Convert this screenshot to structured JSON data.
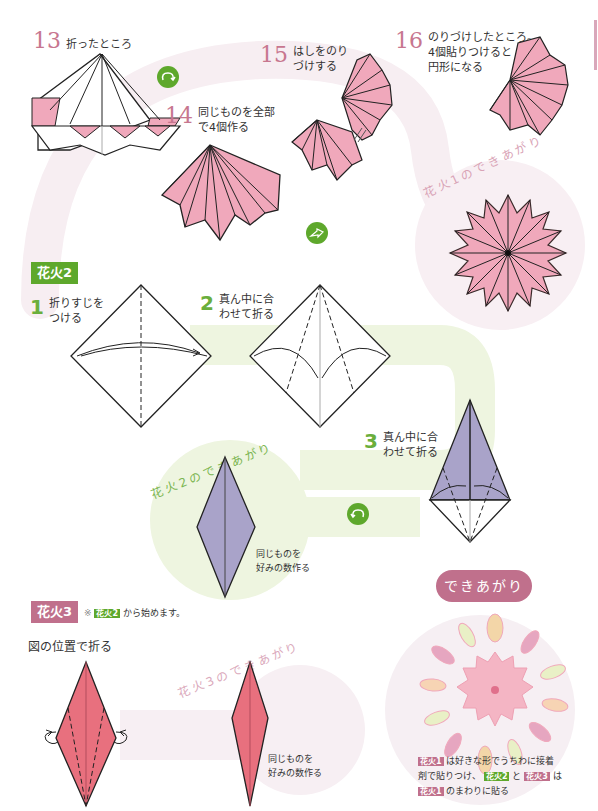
{
  "steps_top": {
    "step13": {
      "num": "13",
      "text": "折ったところ"
    },
    "step14": {
      "num": "14",
      "text_line1": "同じものを全部",
      "text_line2": "で4個作る"
    },
    "step15": {
      "num": "15",
      "text_line1": "はしをのり",
      "text_line2": "づけする"
    },
    "step16": {
      "num": "16",
      "text_line1": "のりづけしたところ。",
      "text_line2": "4個貼りつけると",
      "text_line3": "円形になる"
    },
    "finished1_label": "花火1のできあがり"
  },
  "hanabi2": {
    "title": "花火2",
    "step1": {
      "num": "1",
      "text_line1": "折りすじを",
      "text_line2": "つける"
    },
    "step2": {
      "num": "2",
      "text_line1": "真ん中に合",
      "text_line2": "わせて折る"
    },
    "step3": {
      "num": "3",
      "text_line1": "真ん中に合",
      "text_line2": "わせて折る"
    },
    "finished_label": "花火2のできあがり",
    "note_line1": "同じものを",
    "note_line2": "好みの数作る"
  },
  "hanabi3": {
    "title": "花火3",
    "note_prefix": "※",
    "note_tag": "花火2",
    "note_suffix": "から始めます。",
    "instruction": "図の位置で折る",
    "finished_label": "花火3のできあがり",
    "note_line1": "同じものを",
    "note_line2": "好みの数作る"
  },
  "final": {
    "title": "できあがり",
    "desc": {
      "tag1": "花火1",
      "text1": "は好きな形でうちわに接着",
      "text2": "剤で貼りつけ、",
      "tag2": "花火2",
      "text3": "と",
      "tag3": "花火3",
      "text4": "は",
      "tag4": "花火1",
      "text5": "のまわりに貼る"
    }
  },
  "icons": {
    "turn_over_1": "turn-over-icon",
    "arrow_next": "next-arrow-icon",
    "turn_over_2": "turn-over-icon"
  },
  "colors": {
    "pink_paper": "#f0a8bb",
    "pink_number": "#c7768f",
    "green_accent": "#5ea82c",
    "purple_paper": "#a9a3c9",
    "red_paper": "#e8707e",
    "light_green_bg": "#eaf3d9",
    "light_pink_bg": "#f6eef2"
  }
}
